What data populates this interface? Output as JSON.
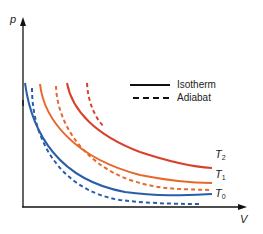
{
  "axes": {
    "y_label": "p",
    "x_label": "V"
  },
  "legend": {
    "isotherm": "Isotherm",
    "adiabat": "Adiabat"
  },
  "curves": {
    "T0": {
      "name": "T",
      "sub": "0",
      "color": "#2a5ea8"
    },
    "T1": {
      "name": "T",
      "sub": "1",
      "color": "#e8672a"
    },
    "T2": {
      "name": "T",
      "sub": "2",
      "color": "#d9402a"
    }
  }
}
